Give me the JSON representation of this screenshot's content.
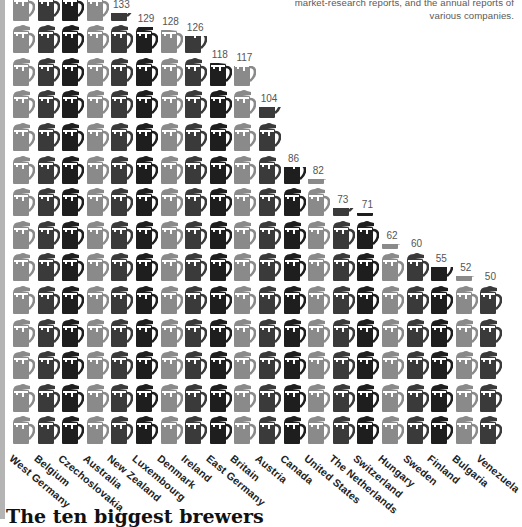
{
  "note": {
    "lines": [
      "market-research reports, and the annual reports of",
      "various companies."
    ]
  },
  "title": "The ten biggest brewers",
  "colors": {
    "gray": "#8a8a8a",
    "dark": "#3a3a3a",
    "darker": "#1e1e1e",
    "foam": "#ffffff"
  },
  "icon": "beer-mug-icon",
  "chart_data": {
    "type": "bar",
    "subtype": "pictogram",
    "unit_per_icon": 10,
    "title": "",
    "xlabel": "",
    "ylabel": "",
    "categories": [
      "West Germany",
      "Belgium",
      "Czechoslovakia",
      "Australia",
      "New Zealand",
      "Luxembourg",
      "Denmark",
      "Ireland",
      "East Germany",
      "Britain",
      "Austria",
      "Canada",
      "United States",
      "The Netherlands",
      "Switzerland",
      "Hungary",
      "Sweden",
      "Finland",
      "Bulgaria",
      "Venezuela"
    ],
    "values": [
      null,
      null,
      null,
      null,
      133,
      129,
      128,
      126,
      118,
      117,
      104,
      86,
      82,
      73,
      71,
      62,
      60,
      55,
      52,
      50
    ],
    "value_labels": [
      "",
      "",
      "",
      "",
      "133",
      "129",
      "128",
      "126",
      "118",
      "117",
      "104",
      "86",
      "82",
      "73",
      "71",
      "62",
      "60",
      "55",
      "52",
      "50"
    ],
    "grid": false,
    "legend": null
  }
}
